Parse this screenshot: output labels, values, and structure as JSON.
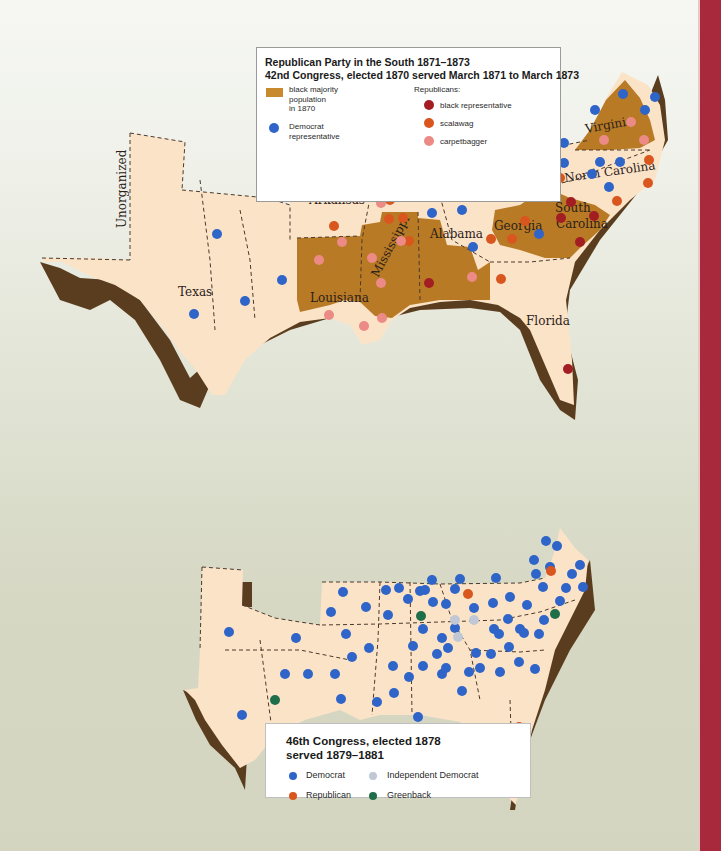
{
  "map_top": {
    "title_line1": "Republican Party in the South 1871–1873",
    "title_line2": "42nd Congress, elected 1870 served March 1871 to March 1873",
    "legend": {
      "black_majority": {
        "label_l1": "black majority",
        "label_l2": "population",
        "label_l3": "in 1870",
        "color": "#c88a2c"
      },
      "democrat": {
        "label_l1": "Democrat",
        "label_l2": "representative",
        "color": "#2f64c8"
      },
      "republicans_heading": "Republicans:",
      "black_rep": {
        "label": "black representative",
        "color": "#a31e22"
      },
      "scalawag": {
        "label": "scalawag",
        "color": "#d9561e"
      },
      "carpetbagger": {
        "label": "carpetbagger",
        "color": "#ec8a86"
      }
    },
    "state_labels": [
      "Unorganized",
      "Texas",
      "Arkansas",
      "Louisiana",
      "Mississippi",
      "Alabama",
      "Tennessee",
      "Georgia",
      "South Carolina",
      "North Carolina",
      "Virginia",
      "Florida"
    ]
  },
  "map_bottom": {
    "title_line1": "46th Congress, elected 1878",
    "title_line2": "served 1879–1881",
    "legend": {
      "democrat": {
        "label": "Democrat",
        "color": "#2f64c8"
      },
      "independent_democrat": {
        "label": "Independent Democrat",
        "color": "#bfc8d4"
      },
      "republican": {
        "label": "Republican",
        "color": "#d9561e"
      },
      "greenback": {
        "label": "Greenback",
        "color": "#1f6e4a"
      }
    }
  },
  "colors": {
    "land": "#fbe3c8",
    "black_majority_fill": "#b97a26",
    "coast_shadow": "#5a3d1e",
    "side_band": "#a8283c"
  }
}
